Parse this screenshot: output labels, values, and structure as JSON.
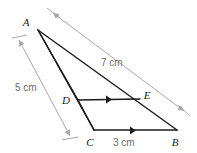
{
  "figure": {
    "background_color": "#ffffff",
    "shape_stroke_color": "#1a1a1a",
    "dimension_stroke_color": "#a8a8a8",
    "label_color": "#1a1a1a",
    "measure_color": "#6b6b6b",
    "vertices": [
      {
        "name": "A",
        "label": "A",
        "x": 38,
        "y": 30,
        "label_x": 26,
        "label_y": 26
      },
      {
        "name": "D",
        "label": "D",
        "x": 78,
        "y": 100,
        "label_x": 64,
        "label_y": 104
      },
      {
        "name": "E",
        "label": "E",
        "x": 140,
        "y": 99,
        "label_x": 136,
        "label_y": 101
      },
      {
        "name": "C",
        "label": "C",
        "x": 94,
        "y": 130,
        "label_x": 86,
        "label_y": 144
      },
      {
        "name": "B",
        "label": "B",
        "x": 177,
        "y": 130,
        "label_x": 172,
        "label_y": 144
      }
    ],
    "segments": [
      {
        "name": "side-AB",
        "from": "A",
        "to": "B",
        "style": "solid"
      },
      {
        "name": "side-AC",
        "from": "A",
        "to": "C",
        "style": "solid"
      },
      {
        "name": "side-CB",
        "from": "C",
        "to": "B",
        "style": "solid"
      },
      {
        "name": "segment-DE",
        "from": "D",
        "to": "E",
        "style": "solid"
      },
      {
        "name": "segment-DC",
        "from": "D",
        "to": "C",
        "style": "solid"
      },
      {
        "name": "segment-EB",
        "from": "E",
        "to": "B",
        "style": "solid"
      }
    ],
    "parallel_marks": [
      {
        "name": "parallel-mark-de",
        "on": "segment-DE"
      },
      {
        "name": "parallel-mark-cb",
        "on": "segment-CB"
      }
    ],
    "measurements": [
      {
        "name": "measure-ab",
        "value": "7 cm",
        "measures": "AB",
        "text_x": 101,
        "text_y": 66,
        "rotation": 0,
        "line": {
          "x1": 53,
          "y1": 13,
          "x2": 184,
          "y2": 111
        }
      },
      {
        "name": "measure-ac",
        "value": "5 cm",
        "measures": "AC",
        "text_x": 15,
        "text_y": 91,
        "rotation": 0,
        "line": {
          "x1": 19,
          "y1": 40,
          "x2": 70,
          "y2": 136
        }
      },
      {
        "name": "measure-cb",
        "value": "3 cm",
        "measures": "CB",
        "text_x": 113,
        "text_y": 144,
        "rotation": 0,
        "line": null
      }
    ]
  }
}
